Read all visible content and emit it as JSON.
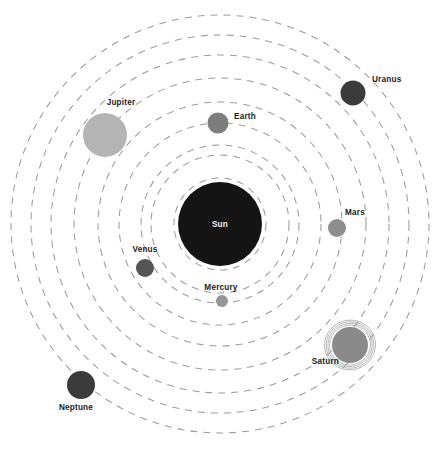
{
  "diagram": {
    "type": "solar-system-schematic",
    "background_color": "#ffffff",
    "canvas": {
      "width": 438,
      "height": 451
    }
  },
  "sun": {
    "label": "Sun",
    "cx": 220,
    "cy": 224,
    "r": 42,
    "color": "#141414",
    "label_color": "#f2f2f2",
    "label_x": 220,
    "label_y": 227
  },
  "orbits": {
    "center_x": 220,
    "center_y": 224,
    "color": "#9b9b9b",
    "dash": "7 6",
    "stroke_width": 1.05,
    "radii": [
      46,
      69,
      79,
      101,
      122,
      146,
      169,
      189,
      209
    ]
  },
  "planets": [
    {
      "name": "Mercury",
      "cx": 222,
      "cy": 301,
      "r": 6,
      "color": "#969696",
      "label": "Mercury",
      "label_x": 221,
      "label_y": 290,
      "label_anchor": "middle"
    },
    {
      "name": "Venus",
      "cx": 145,
      "cy": 268,
      "r": 9,
      "color": "#545454",
      "label": "Venus",
      "label_x": 145,
      "label_y": 252,
      "label_anchor": "middle"
    },
    {
      "name": "Earth",
      "cx": 218,
      "cy": 123,
      "r": 10.5,
      "color": "#7d7d7d",
      "label": "Earth",
      "label_x": 234,
      "label_y": 119,
      "label_anchor": "start"
    },
    {
      "name": "Mars",
      "cx": 337,
      "cy": 228,
      "r": 9,
      "color": "#8e8e8e",
      "label": "Mars",
      "label_x": 345,
      "label_y": 215,
      "label_anchor": "start"
    },
    {
      "name": "Jupiter",
      "cx": 105,
      "cy": 135,
      "r": 22,
      "color": "#b4b4b4",
      "label": "Jupiter",
      "label_x": 121,
      "label_y": 105,
      "label_anchor": "middle"
    },
    {
      "name": "Saturn",
      "cx": 350,
      "cy": 345,
      "r": 18,
      "color": "#8a8a8a",
      "label": "Saturn",
      "label_x": 339,
      "label_y": 364,
      "label_anchor": "end",
      "has_rings": true,
      "ring_radii": [
        20.5,
        22.2,
        23.9,
        25.6
      ]
    },
    {
      "name": "Uranus",
      "cx": 353,
      "cy": 93,
      "r": 12.5,
      "color": "#3b3b3b",
      "label": "Uranus",
      "label_x": 372,
      "label_y": 82,
      "label_anchor": "start"
    },
    {
      "name": "Neptune",
      "cx": 81,
      "cy": 385,
      "r": 14,
      "color": "#3b3b3b",
      "label": "Neptune",
      "label_x": 76,
      "label_y": 410,
      "label_anchor": "middle"
    }
  ]
}
